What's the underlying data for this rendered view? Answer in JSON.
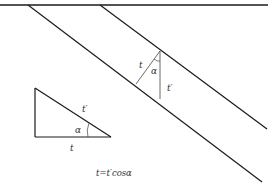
{
  "diagram": {
    "colors": {
      "stroke": "#1a1a1a",
      "thin": "#444444",
      "text": "#333333"
    },
    "layer_labels": {
      "t": "t",
      "t_prime": "t′",
      "alpha": "α"
    },
    "triangle_labels": {
      "t": "t",
      "t_prime": "t′",
      "alpha": "α"
    },
    "formula": "t=t′cosα"
  }
}
